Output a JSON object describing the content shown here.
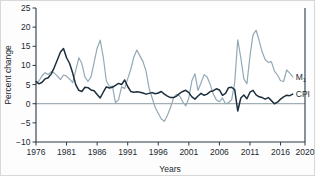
{
  "chart_data": {
    "type": "line",
    "title": "",
    "xlabel": "Years",
    "ylabel": "Percent change",
    "xlim": [
      1976,
      2020
    ],
    "ylim": [
      -10,
      25
    ],
    "xticks": [
      1976,
      1981,
      1986,
      1991,
      1996,
      2001,
      2006,
      2011,
      2016,
      2020
    ],
    "yticks": [
      -10,
      -5,
      0,
      5,
      10,
      15,
      20,
      25
    ],
    "xtick_labels": [
      "1976",
      "1981",
      "1986",
      "1991",
      "1996",
      "2001",
      "2006",
      "2011",
      "2016",
      "2020"
    ],
    "ytick_labels": [
      "−10",
      "−5",
      "0",
      "5",
      "10",
      "15",
      "20",
      "25"
    ],
    "grid": false,
    "legend_position": "inline-right",
    "zero_line": 0,
    "colors": {
      "cpi": "#1d2f3c",
      "m1": "#93a9b5",
      "axis": "#2b3a44",
      "zero": "#8d9aa2",
      "text": "#222a31",
      "background": "#fdfdfd"
    },
    "series": [
      {
        "name": "M1",
        "label": "M",
        "label_sub": "1",
        "color": "#93a9b5",
        "x": [
          1976.0,
          1976.5,
          1977.0,
          1977.5,
          1978.0,
          1978.5,
          1979.0,
          1979.5,
          1980.0,
          1980.5,
          1981.0,
          1981.5,
          1982.0,
          1982.5,
          1983.0,
          1983.5,
          1984.0,
          1984.5,
          1985.0,
          1985.5,
          1986.0,
          1986.5,
          1987.0,
          1987.5,
          1988.0,
          1988.5,
          1989.0,
          1989.5,
          1990.0,
          1990.5,
          1991.0,
          1991.5,
          1992.0,
          1992.5,
          1993.0,
          1993.5,
          1994.0,
          1994.5,
          1995.0,
          1995.5,
          1996.0,
          1996.5,
          1997.0,
          1997.5,
          1998.0,
          1998.5,
          1999.0,
          1999.5,
          2000.0,
          2000.5,
          2001.0,
          2001.5,
          2002.0,
          2002.5,
          2003.0,
          2003.5,
          2004.0,
          2004.5,
          2005.0,
          2005.5,
          2006.0,
          2006.5,
          2007.0,
          2007.5,
          2008.0,
          2008.5,
          2009.0,
          2009.5,
          2010.0,
          2010.5,
          2011.0,
          2011.5,
          2012.0,
          2012.5,
          2013.0,
          2013.5,
          2014.0,
          2014.5,
          2015.0,
          2015.5,
          2016.0,
          2016.5,
          2017.0,
          2017.5,
          2018.0
        ],
        "values": [
          5.2,
          6.0,
          7.3,
          8.1,
          7.6,
          8.4,
          8.0,
          7.2,
          6.3,
          7.5,
          7.2,
          6.4,
          5.5,
          8.7,
          12.0,
          10.5,
          7.0,
          5.8,
          7.0,
          10.8,
          14.5,
          16.6,
          12.2,
          6.0,
          4.5,
          4.6,
          0.3,
          1.0,
          4.4,
          4.0,
          6.5,
          9.0,
          12.2,
          14.0,
          12.5,
          11.0,
          8.5,
          4.0,
          1.5,
          -1.0,
          -2.5,
          -4.0,
          -4.6,
          -3.0,
          -1.0,
          1.5,
          2.5,
          2.0,
          0.5,
          -0.6,
          1.5,
          6.0,
          7.8,
          3.5,
          5.5,
          7.6,
          7.0,
          5.0,
          2.5,
          1.0,
          0.5,
          1.5,
          0.0,
          0.3,
          1.0,
          5.5,
          16.7,
          12.0,
          6.5,
          5.2,
          12.5,
          18.0,
          19.2,
          16.5,
          13.5,
          11.5,
          10.8,
          11.0,
          8.5,
          7.5,
          6.0,
          5.8,
          8.8,
          8.0,
          7.0
        ]
      },
      {
        "name": "CPI",
        "label": "CPI",
        "label_sub": "",
        "color": "#1d2f3c",
        "x": [
          1976.0,
          1976.5,
          1977.0,
          1977.5,
          1978.0,
          1978.5,
          1979.0,
          1979.5,
          1980.0,
          1980.5,
          1981.0,
          1981.5,
          1982.0,
          1982.5,
          1983.0,
          1983.5,
          1984.0,
          1984.5,
          1985.0,
          1985.5,
          1986.0,
          1986.5,
          1987.0,
          1987.5,
          1988.0,
          1988.5,
          1989.0,
          1989.5,
          1990.0,
          1990.5,
          1991.0,
          1991.5,
          1992.0,
          1992.5,
          1993.0,
          1993.5,
          1994.0,
          1994.5,
          1995.0,
          1995.5,
          1996.0,
          1996.5,
          1997.0,
          1997.5,
          1998.0,
          1998.5,
          1999.0,
          1999.5,
          2000.0,
          2000.5,
          2001.0,
          2001.5,
          2002.0,
          2002.5,
          2003.0,
          2003.5,
          2004.0,
          2004.5,
          2005.0,
          2005.5,
          2006.0,
          2006.5,
          2007.0,
          2007.5,
          2008.0,
          2008.5,
          2009.0,
          2009.5,
          2010.0,
          2010.5,
          2011.0,
          2011.5,
          2012.0,
          2012.5,
          2013.0,
          2013.5,
          2014.0,
          2014.5,
          2015.0,
          2015.5,
          2016.0,
          2016.5,
          2017.0,
          2017.5,
          2018.0
        ],
        "values": [
          5.8,
          5.2,
          5.6,
          6.5,
          6.8,
          7.8,
          9.5,
          11.5,
          13.5,
          14.4,
          12.0,
          10.5,
          8.0,
          5.0,
          3.5,
          3.2,
          4.3,
          4.2,
          3.6,
          3.4,
          2.4,
          1.5,
          3.0,
          4.4,
          4.1,
          4.3,
          4.8,
          5.3,
          5.0,
          6.2,
          4.5,
          3.2,
          3.0,
          3.1,
          3.0,
          2.8,
          2.5,
          2.7,
          2.9,
          2.6,
          2.8,
          3.2,
          2.5,
          2.0,
          1.6,
          1.6,
          2.0,
          2.7,
          3.2,
          3.5,
          2.9,
          1.8,
          1.2,
          2.0,
          2.7,
          2.2,
          2.5,
          3.2,
          3.4,
          3.9,
          3.6,
          2.2,
          2.7,
          4.2,
          4.3,
          3.7,
          -1.9,
          1.5,
          2.3,
          1.3,
          3.0,
          3.5,
          2.3,
          1.8,
          1.6,
          1.2,
          1.6,
          0.8,
          0.0,
          0.4,
          1.2,
          1.8,
          2.2,
          2.1,
          2.5
        ]
      }
    ]
  }
}
